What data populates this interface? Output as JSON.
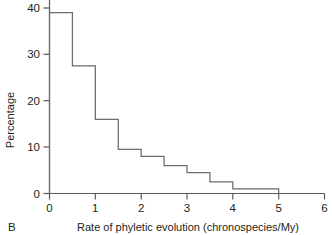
{
  "figure": {
    "panel_label": "B",
    "background": "#ffffff",
    "line_color": "#6e6c6d",
    "text_color": "#231f20"
  },
  "chart_data": {
    "type": "bar",
    "style": "step-histogram",
    "title": "",
    "subtitle": "",
    "xlabel": "Rate of phyletic evolution (chronospecies/My)",
    "ylabel": "Percentage",
    "xlim": [
      0,
      6
    ],
    "ylim": [
      0,
      40
    ],
    "xticks": [
      0,
      1,
      2,
      3,
      4,
      5,
      6
    ],
    "xtick_labels": [
      "0",
      "1",
      "2",
      "3",
      "4",
      "5",
      "6"
    ],
    "yticks": [
      0,
      10,
      20,
      30,
      40
    ],
    "ytick_labels": [
      "0",
      "10",
      "20",
      "30",
      "40"
    ],
    "ytick_labels_visible": [
      "0",
      "10",
      "20",
      "30"
    ],
    "grid": false,
    "legend": null,
    "bin_width": 0.5,
    "bin_edges": [
      0,
      0.5,
      1.0,
      1.5,
      2.0,
      2.5,
      3.0,
      3.5,
      4.0,
      4.5,
      5.0
    ],
    "categories": [
      "0.0-0.5",
      "0.5-1.0",
      "1.0-1.5",
      "1.5-2.0",
      "2.0-2.5",
      "2.5-3.0",
      "3.0-3.5",
      "3.5-4.0",
      "4.0-4.5",
      "4.5-5.0"
    ],
    "values": [
      39,
      27.5,
      16,
      9.5,
      8,
      6,
      4.5,
      2.5,
      1,
      1
    ]
  }
}
